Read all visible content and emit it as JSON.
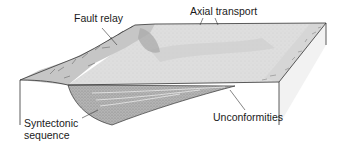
{
  "diagram": {
    "type": "block-diagram",
    "colors": {
      "outline": "#333333",
      "top_surface": "#dcdcdc",
      "hangingwall_slope": "#c8c8c8",
      "fault_scarp": "#d0d0d0",
      "syntectonic_fill": "#a8a8a8",
      "front_face": "#ffffff"
    },
    "labels": [
      {
        "id": "fault-relay",
        "text": "Fault relay"
      },
      {
        "id": "axial-transport",
        "text": "Axial transport"
      },
      {
        "id": "syntectonic-sequence",
        "text": "Syntectonic\nsequence",
        "lines": [
          "Syntectonic",
          "sequence"
        ]
      },
      {
        "id": "unconformities",
        "text": "Unconformities"
      }
    ]
  }
}
